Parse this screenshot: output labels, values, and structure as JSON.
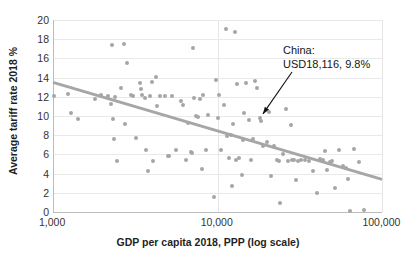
{
  "chart_data": {
    "type": "scatter",
    "title": "",
    "xlabel": "GDP per capita 2018, PPP (log scale)",
    "ylabel": "Average tariff rate 2018 %",
    "xscale": "log",
    "xlim": [
      1000,
      100000
    ],
    "ylim": [
      0,
      20
    ],
    "xticks": [
      "1,000",
      "10,000",
      "100,000"
    ],
    "xtick_values": [
      1000,
      10000,
      100000
    ],
    "yticks": [
      "0",
      "2",
      "4",
      "6",
      "8",
      "10",
      "12",
      "14",
      "16",
      "18",
      "20"
    ],
    "ytick_values": [
      0,
      2,
      4,
      6,
      8,
      10,
      12,
      14,
      16,
      18,
      20
    ],
    "grid": "horizontal-and-vertical",
    "legend": "none",
    "series_name": "Countries",
    "point_color": "#a6a6a6",
    "trendline": {
      "color": "#a6a6a6",
      "x_start": 1000,
      "y_start": 13.5,
      "x_end": 100000,
      "y_end": 3.4
    },
    "annotations": [
      {
        "name": "china-label",
        "line1": "China:",
        "line2": "USD18,116, 9.8%",
        "point_x": 18116,
        "point_y": 9.8,
        "arrow": true
      }
    ],
    "points": [
      [
        1020,
        12.1
      ],
      [
        1230,
        12.3
      ],
      [
        1290,
        10.3
      ],
      [
        1420,
        9.7
      ],
      [
        1800,
        11.8
      ],
      [
        1950,
        12.2
      ],
      [
        2150,
        12.1
      ],
      [
        2250,
        11.3
      ],
      [
        2280,
        17.4
      ],
      [
        2300,
        9.7
      ],
      [
        2350,
        7.6
      ],
      [
        2380,
        12.0
      ],
      [
        2450,
        5.3
      ],
      [
        2600,
        12.9
      ],
      [
        2700,
        17.5
      ],
      [
        2750,
        9.2
      ],
      [
        2800,
        15.5
      ],
      [
        3000,
        12.2
      ],
      [
        3050,
        12.1
      ],
      [
        3200,
        7.7
      ],
      [
        3400,
        13.4
      ],
      [
        3450,
        12.8
      ],
      [
        3500,
        12.2
      ],
      [
        3600,
        11.9
      ],
      [
        3700,
        6.5
      ],
      [
        3800,
        4.3
      ],
      [
        3900,
        12.1
      ],
      [
        4000,
        13.5
      ],
      [
        4050,
        5.3
      ],
      [
        4200,
        14.1
      ],
      [
        4300,
        11.0
      ],
      [
        4500,
        12.1
      ],
      [
        4800,
        12.1
      ],
      [
        5000,
        5.8
      ],
      [
        5100,
        5.8
      ],
      [
        5300,
        12.1
      ],
      [
        5600,
        6.5
      ],
      [
        6000,
        11.6
      ],
      [
        6200,
        11.1
      ],
      [
        6400,
        5.4
      ],
      [
        6600,
        9.3
      ],
      [
        6900,
        6.2
      ],
      [
        7000,
        6.1
      ],
      [
        7100,
        17.1
      ],
      [
        7200,
        11.9
      ],
      [
        7400,
        10.0
      ],
      [
        7600,
        9.9
      ],
      [
        7800,
        11.8
      ],
      [
        8000,
        4.5
      ],
      [
        8200,
        12.2
      ],
      [
        8500,
        6.5
      ],
      [
        8800,
        10.1
      ],
      [
        9500,
        1.6
      ],
      [
        9800,
        13.8
      ],
      [
        10000,
        9.8
      ],
      [
        10200,
        12.2
      ],
      [
        10500,
        6.5
      ],
      [
        11000,
        11.1
      ],
      [
        11200,
        19.1
      ],
      [
        11500,
        7.9
      ],
      [
        11800,
        5.6
      ],
      [
        12000,
        8.0
      ],
      [
        12200,
        2.7
      ],
      [
        12500,
        9.2
      ],
      [
        12800,
        18.8
      ],
      [
        13000,
        5.4
      ],
      [
        13200,
        13.3
      ],
      [
        13500,
        5.6
      ],
      [
        14000,
        3.9
      ],
      [
        14200,
        7.5
      ],
      [
        14500,
        10.3
      ],
      [
        15000,
        13.4
      ],
      [
        15500,
        9.6
      ],
      [
        16000,
        5.4
      ],
      [
        16500,
        7.6
      ],
      [
        17000,
        13.6
      ],
      [
        17500,
        12.9
      ],
      [
        18116,
        9.8
      ],
      [
        18500,
        9.5
      ],
      [
        19000,
        6.9
      ],
      [
        20000,
        7.3
      ],
      [
        20500,
        10.4
      ],
      [
        21000,
        3.8
      ],
      [
        22000,
        6.9
      ],
      [
        23000,
        5.4
      ],
      [
        23500,
        5.3
      ],
      [
        24000,
        0.9
      ],
      [
        25000,
        6.0
      ],
      [
        26000,
        10.7
      ],
      [
        27000,
        5.3
      ],
      [
        28000,
        9.1
      ],
      [
        28500,
        5.4
      ],
      [
        29000,
        5.4
      ],
      [
        30000,
        3.3
      ],
      [
        31000,
        5.3
      ],
      [
        32000,
        5.4
      ],
      [
        34000,
        5.4
      ],
      [
        36000,
        5.3
      ],
      [
        38000,
        4.3
      ],
      [
        40000,
        2.0
      ],
      [
        42000,
        5.5
      ],
      [
        44000,
        5.4
      ],
      [
        45000,
        6.4
      ],
      [
        46000,
        4.4
      ],
      [
        48000,
        5.2
      ],
      [
        50000,
        5.3
      ],
      [
        52000,
        2.5
      ],
      [
        55000,
        6.5
      ],
      [
        58000,
        4.8
      ],
      [
        60000,
        4.6
      ],
      [
        62000,
        3.4
      ],
      [
        64000,
        0.1
      ],
      [
        68000,
        6.6
      ],
      [
        72000,
        5.2
      ],
      [
        78000,
        0.2
      ]
    ]
  }
}
